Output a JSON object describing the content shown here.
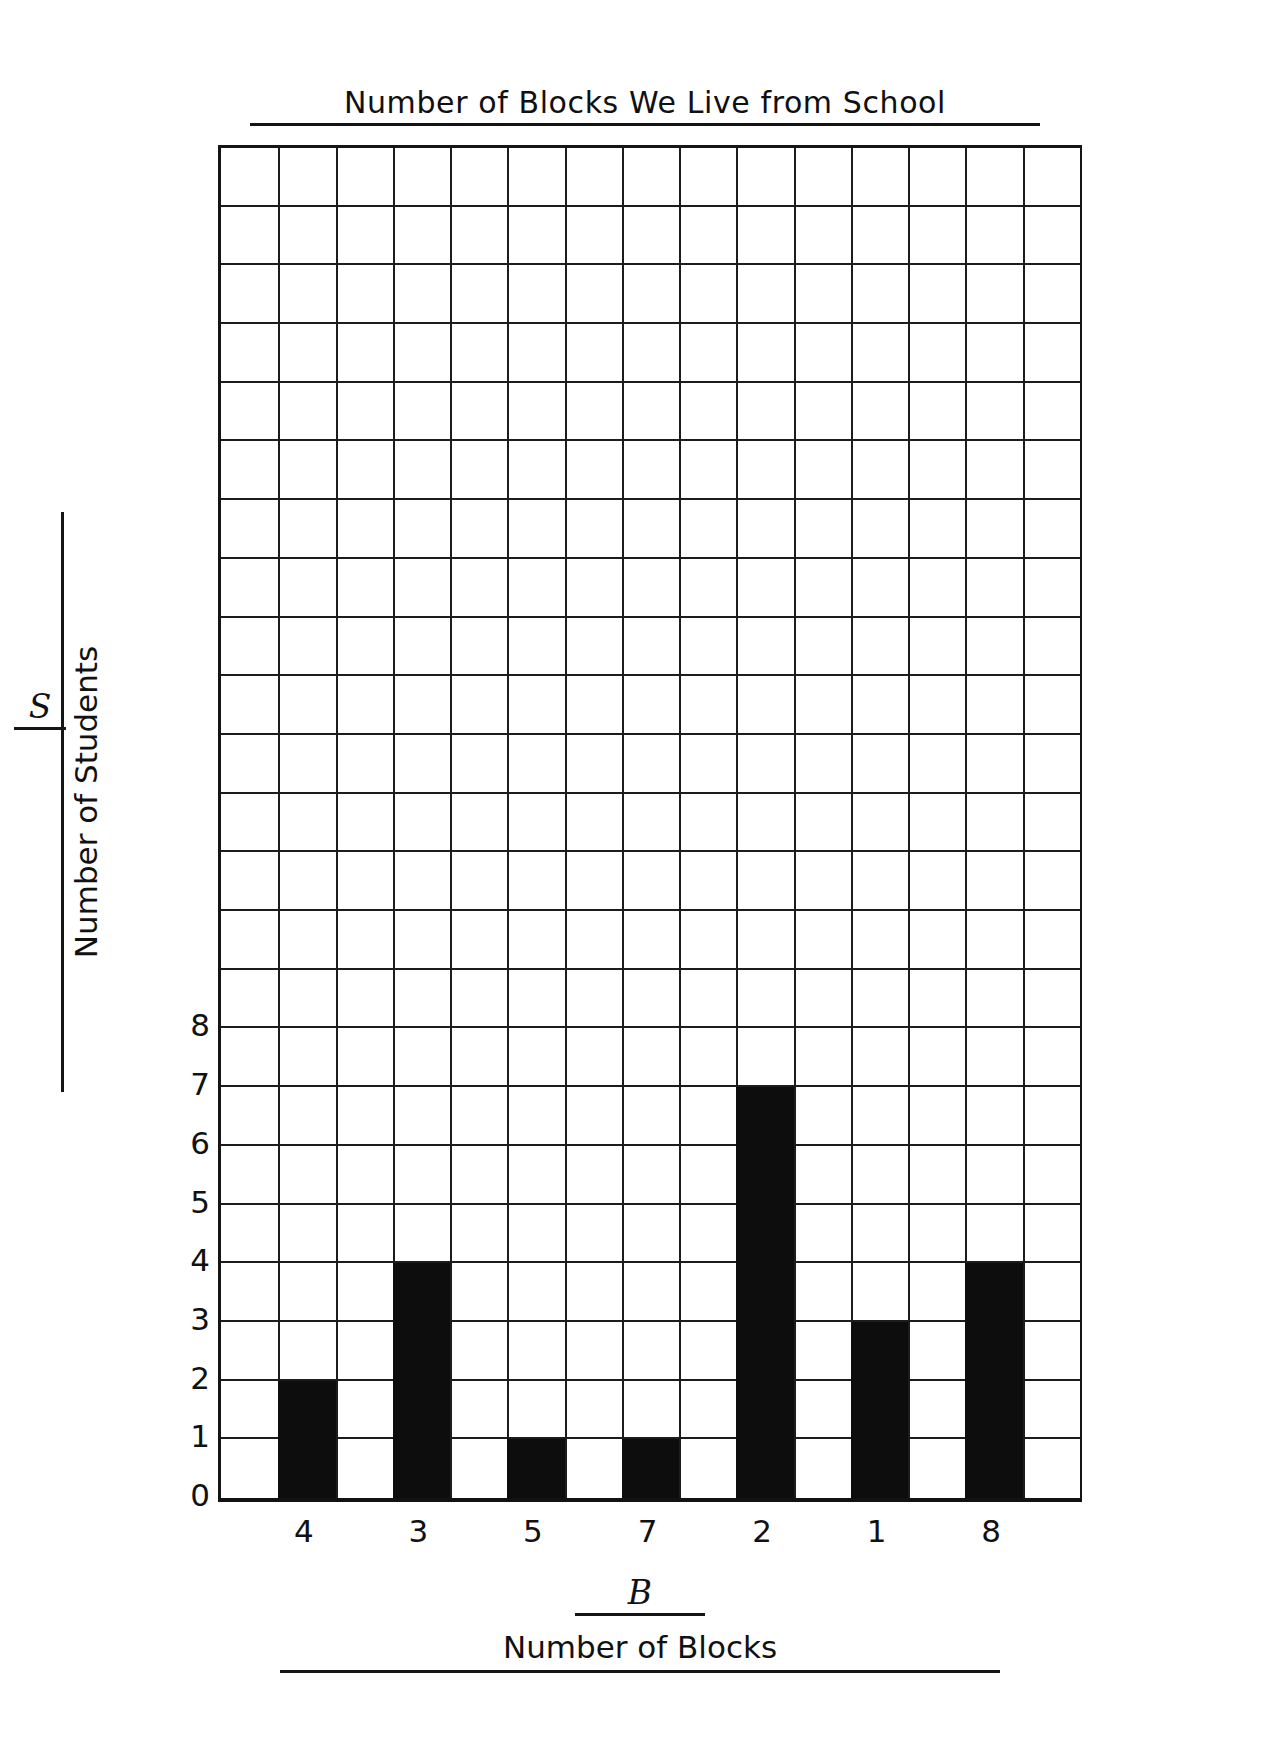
{
  "chart_data": {
    "type": "bar",
    "title": "Number of Blocks We Live from School",
    "xlabel": "Number of Blocks",
    "ylabel": "Number of Students",
    "x_variable_letter": "B",
    "y_variable_letter": "S",
    "categories": [
      "4",
      "3",
      "5",
      "7",
      "2",
      "1",
      "8"
    ],
    "values": [
      2,
      4,
      1,
      1,
      7,
      3,
      4
    ],
    "y_ticks": [
      "8",
      "7",
      "6",
      "5",
      "4",
      "3",
      "2",
      "1",
      "0"
    ],
    "y_tick_values": [
      8,
      7,
      6,
      5,
      4,
      3,
      2,
      1,
      0
    ],
    "ylim": [
      0,
      23
    ],
    "grid": true,
    "grid_columns": 15,
    "grid_rows": 23,
    "bar_columns": [
      2,
      4,
      6,
      8,
      10,
      12,
      14
    ],
    "bar_color": "#0d0d0d",
    "grid_color": "#1c1c1c",
    "axis_color": "#151515",
    "background": "#ffffff",
    "legend": null,
    "legend_position": "none"
  },
  "chart": {
    "title": "Number of Blocks We Live from School",
    "x_axis": {
      "variable": "B",
      "title": "Number of Blocks",
      "ticks": [
        "4",
        "3",
        "5",
        "7",
        "2",
        "1",
        "8"
      ]
    },
    "y_axis": {
      "variable": "S",
      "title": "Number of Students",
      "ticks": [
        "8",
        "7",
        "6",
        "5",
        "4",
        "3",
        "2",
        "1",
        "0"
      ]
    }
  }
}
